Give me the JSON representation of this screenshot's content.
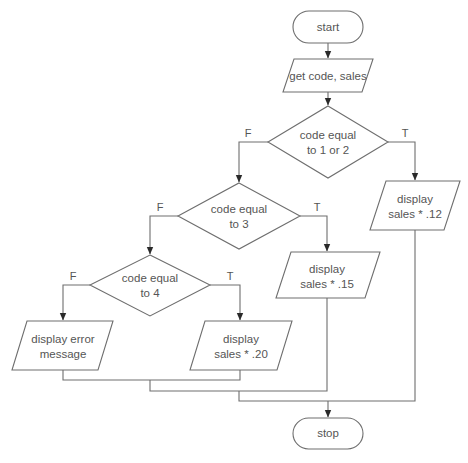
{
  "diagram": {
    "type": "flowchart",
    "nodes": {
      "start": {
        "shape": "terminal",
        "label": "start"
      },
      "input": {
        "shape": "parallelogram",
        "label": "get code, sales"
      },
      "decision1": {
        "shape": "diamond",
        "line1": "code equal",
        "line2": "to 1 or 2"
      },
      "decision2": {
        "shape": "diamond",
        "line1": "code equal",
        "line2": "to 3"
      },
      "decision3": {
        "shape": "diamond",
        "line1": "code equal",
        "line2": "to 4"
      },
      "out12": {
        "shape": "parallelogram",
        "line1": "display",
        "line2": "sales * .12"
      },
      "out15": {
        "shape": "parallelogram",
        "line1": "display",
        "line2": "sales * .15"
      },
      "out20": {
        "shape": "parallelogram",
        "line1": "display",
        "line2": "sales * .20"
      },
      "outErr": {
        "shape": "parallelogram",
        "line1": "display error",
        "line2": "message"
      },
      "stop": {
        "shape": "terminal",
        "label": "stop"
      }
    },
    "branch_labels": {
      "true": "T",
      "false": "F"
    },
    "edges": [
      {
        "from": "start",
        "to": "input"
      },
      {
        "from": "input",
        "to": "decision1"
      },
      {
        "from": "decision1",
        "to": "out12",
        "label": "T"
      },
      {
        "from": "decision1",
        "to": "decision2",
        "label": "F"
      },
      {
        "from": "decision2",
        "to": "out15",
        "label": "T"
      },
      {
        "from": "decision2",
        "to": "decision3",
        "label": "F"
      },
      {
        "from": "decision3",
        "to": "out20",
        "label": "T"
      },
      {
        "from": "decision3",
        "to": "outErr",
        "label": "F"
      },
      {
        "from": "outErr",
        "to": "stop"
      },
      {
        "from": "out20",
        "to": "stop"
      },
      {
        "from": "out15",
        "to": "stop"
      },
      {
        "from": "out12",
        "to": "stop"
      }
    ],
    "colors": {
      "stroke": "#6e6e6e",
      "text": "#555555",
      "arrow": "#2a2a2a",
      "background": "#ffffff"
    }
  }
}
